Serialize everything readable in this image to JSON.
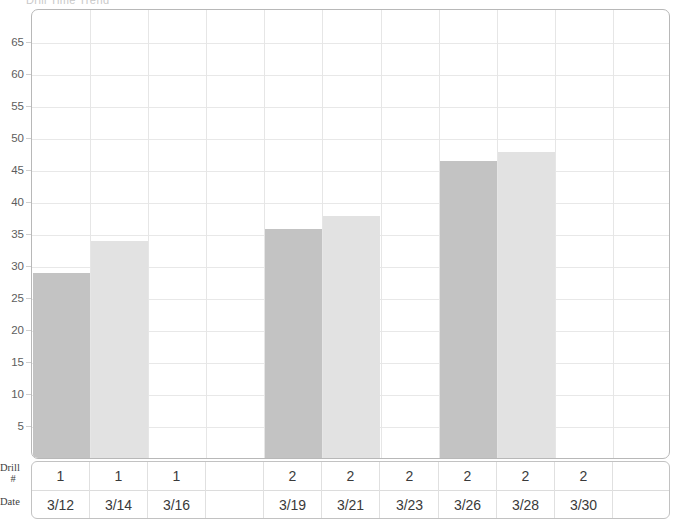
{
  "title_sliver": "Drill Time Trend",
  "chart_data": {
    "type": "bar",
    "title": "",
    "xlabel": "",
    "ylabel": "",
    "ylim": [
      0,
      68
    ],
    "grid": true,
    "legend": "none",
    "y_ticks": [
      65,
      60,
      55,
      50,
      45,
      40,
      35,
      30,
      25,
      20,
      15,
      10,
      5
    ],
    "categories": [
      "3/12",
      "3/14",
      "3/16",
      "",
      "3/19",
      "3/21",
      "3/23",
      "3/26",
      "3/28",
      "3/30",
      ""
    ],
    "values": [
      29,
      34,
      null,
      null,
      36,
      38,
      null,
      46.5,
      48,
      null,
      null
    ],
    "bar_shades": [
      "dark",
      "light",
      null,
      null,
      "dark",
      "light",
      null,
      "dark",
      "light",
      null,
      null
    ],
    "series": [
      {
        "name": "Measurement",
        "values": [
          29,
          34,
          null,
          null,
          36,
          38,
          null,
          46.5,
          48,
          null,
          null
        ]
      }
    ],
    "colors": {
      "bar_dark": "#c3c3c3",
      "bar_light": "#e2e2e2",
      "grid": "#e8e8e8",
      "axis": "#b8b8b8",
      "text": "#5d5d5d"
    }
  },
  "table": {
    "rows": [
      {
        "header_line1": "Drill",
        "header_line2": "#",
        "cells": [
          "1",
          "1",
          "1",
          "",
          "2",
          "2",
          "2",
          "2",
          "2",
          "2",
          ""
        ]
      },
      {
        "header_line1": "Date",
        "header_line2": "",
        "cells": [
          "3/12",
          "3/14",
          "3/16",
          "",
          "3/19",
          "3/21",
          "3/23",
          "3/26",
          "3/28",
          "3/30",
          ""
        ]
      }
    ]
  }
}
